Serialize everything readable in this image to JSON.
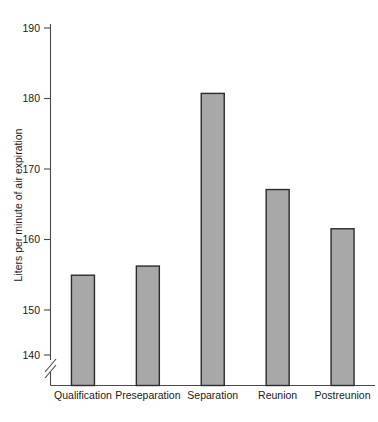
{
  "chart_data": {
    "type": "bar",
    "title": "",
    "subtitle": "",
    "xlabel": "",
    "ylabel": "Liters per minute of air expiration",
    "categories": [
      "Qualification",
      "Preseparation",
      "Separation",
      "Reunion",
      "Postreunion"
    ],
    "values": [
      152.2,
      153.6,
      180.0,
      165.3,
      159.3
    ],
    "series": [
      {
        "name": "Air expiration",
        "values": [
          152.2,
          153.6,
          180.0,
          165.3,
          159.3
        ]
      }
    ],
    "ylim": [
      136,
      193
    ],
    "yticks": [
      140,
      150,
      160,
      170,
      180,
      190
    ],
    "ytick_labels": [
      "140",
      "150",
      "160",
      "170",
      "180",
      "190"
    ],
    "grid": false,
    "legend": false,
    "legend_position": "none",
    "axis_break": true,
    "axis_break_note": "y-axis broken below 140",
    "bar_color": "#a8a8a8",
    "bar_edge_color": "#2b2b2b",
    "axis_color": "#4a4a4a",
    "background": "#ffffff"
  }
}
